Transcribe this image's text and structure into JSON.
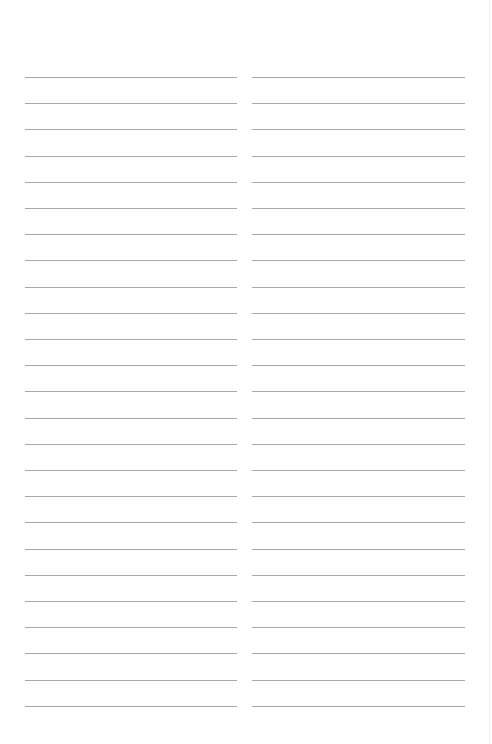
{
  "page": {
    "type": "blank-lined-sheet",
    "columns": 2,
    "lines_per_column": 25,
    "first_line_y": 77,
    "line_spacing": 26.2,
    "rule_color": "#a8a8a8",
    "background_color": "#ffffff"
  },
  "columns": [
    {
      "name": "left",
      "lines": [
        "",
        "",
        "",
        "",
        "",
        "",
        "",
        "",
        "",
        "",
        "",
        "",
        "",
        "",
        "",
        "",
        "",
        "",
        "",
        "",
        "",
        "",
        "",
        "",
        ""
      ]
    },
    {
      "name": "right",
      "lines": [
        "",
        "",
        "",
        "",
        "",
        "",
        "",
        "",
        "",
        "",
        "",
        "",
        "",
        "",
        "",
        "",
        "",
        "",
        "",
        "",
        "",
        "",
        "",
        "",
        ""
      ]
    }
  ]
}
